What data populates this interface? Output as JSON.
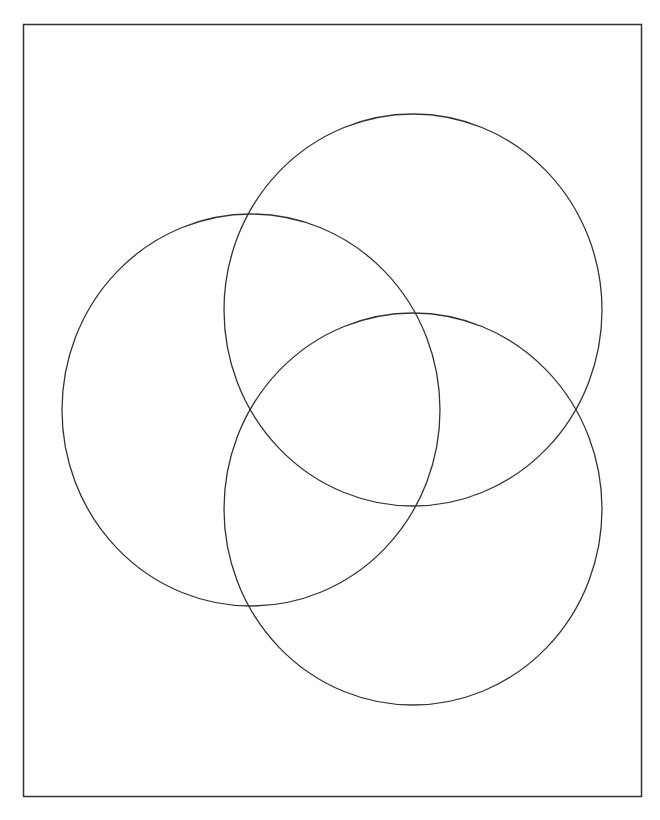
{
  "diagram": {
    "type": "venn",
    "set_count": 3,
    "labels": [],
    "stroke_color": "#333333",
    "background_color": "#ffffff",
    "frame": {
      "x": 23,
      "y": 24,
      "width": 618,
      "height": 772
    },
    "circles": [
      {
        "name": "top-right",
        "cx": 413,
        "cy": 310,
        "rx": 189,
        "ry": 196
      },
      {
        "name": "left",
        "cx": 251,
        "cy": 410,
        "rx": 189,
        "ry": 196
      },
      {
        "name": "bottom",
        "cx": 413,
        "cy": 509,
        "rx": 189,
        "ry": 196
      }
    ]
  }
}
